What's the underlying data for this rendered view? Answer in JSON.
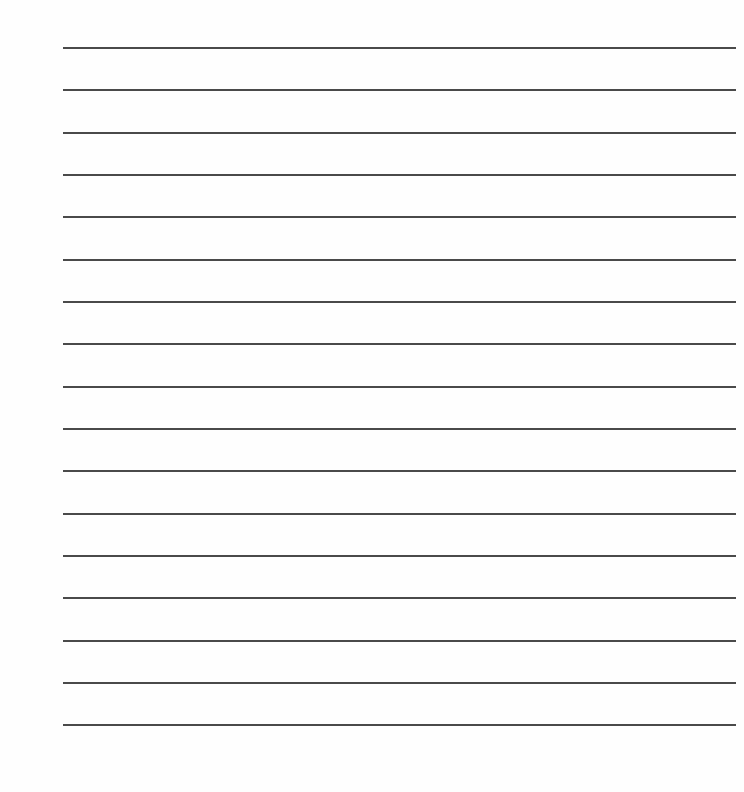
{
  "page": {
    "type": "lined-paper",
    "line_count": 17,
    "line_color": "#4a4a4a",
    "background": "#ffffff",
    "lines_y": [
      47,
      89,
      132,
      174,
      216,
      259,
      301,
      343,
      386,
      428,
      470,
      513,
      555,
      597,
      640,
      682,
      724
    ]
  }
}
